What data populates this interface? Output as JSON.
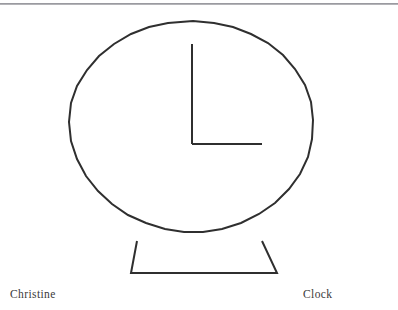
{
  "page": {
    "width": 398,
    "height": 310,
    "background_color": "#ffffff",
    "rule_color": "#b4b4b8"
  },
  "captions": {
    "left_label": "Christine",
    "right_label": "Clock"
  },
  "drawing": {
    "title": "Clock",
    "author": "Christine",
    "style": "hand-drawn line drawing",
    "stroke_color": "#2f2f2f",
    "stroke_width": 2,
    "fill": "none",
    "clock_face": {
      "shape": "circle",
      "center_x": 193,
      "center_y": 134,
      "radius_x": 120,
      "radius_y": 113,
      "points": "193,21 214,23 233,27 251,34 268,43 283,55 295,69 305,85 311,102 313,120 312,139 308,157 300,174 289,189 275,203 259,214 241,223 222,229 203,232 184,232 165,229 146,223 128,215 112,204 98,191 86,176 77,159 71,141 69,122 71,103 77,86 87,70 99,56 114,44 131,34 149,27 168,23"
    },
    "hands": {
      "center_x": 192,
      "center_y": 144,
      "minute_hand": {
        "name": "vertical-hand",
        "direction": "up",
        "from_x": 192,
        "from_y": 144,
        "to_x": 192,
        "to_y": 44
      },
      "hour_hand": {
        "name": "horizontal-hand",
        "direction": "right",
        "from_x": 192,
        "from_y": 144,
        "to_x": 262,
        "to_y": 144
      }
    },
    "stand": {
      "shape": "trapezoid",
      "top_left_x": 137,
      "top_left_y": 241,
      "top_right_x": 262,
      "top_right_y": 241,
      "bottom_right_x": 277,
      "bottom_right_y": 273,
      "bottom_left_x": 131,
      "bottom_left_y": 273
    }
  }
}
